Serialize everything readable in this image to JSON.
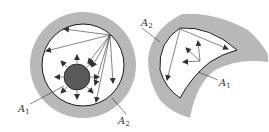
{
  "figure": {
    "colors": {
      "insulation": "#b5b5b5",
      "surface_line": "#1a1a1a",
      "inner_body": "#5a5a5a",
      "arrow": "#333333",
      "background": "#ffffff"
    },
    "left_panel": {
      "description": "Enclosure A2 (concentric sphere/cylinder) surrounding body A1",
      "labels": [
        {
          "id": "A1",
          "main": "A",
          "sub": "1"
        },
        {
          "id": "A2",
          "main": "A",
          "sub": "2"
        }
      ]
    },
    "right_panel": {
      "description": "Concave surface A2 and convex surface A1 forming an enclosure",
      "labels": [
        {
          "id": "A2",
          "main": "A",
          "sub": "2"
        },
        {
          "id": "A1",
          "main": "A",
          "sub": "1"
        }
      ]
    }
  }
}
